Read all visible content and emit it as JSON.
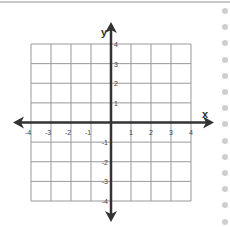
{
  "diagram": {
    "type": "coordinate-plane",
    "x_axis_label": "x",
    "y_axis_label": "y",
    "x_range": [
      -4,
      4
    ],
    "y_range": [
      -4,
      4
    ],
    "x_ticks": [
      "-4",
      "-3",
      "-2",
      "-1",
      "1",
      "2",
      "3",
      "4"
    ],
    "y_ticks": [
      "4",
      "3",
      "2",
      "1",
      "-1",
      "-2",
      "-3",
      "-4"
    ],
    "grid_step": 1
  },
  "sidebar": {
    "dot_count": 14,
    "dot_color": "#cfcfcf"
  },
  "colors": {
    "axis": "#333333",
    "grid": "#999999",
    "top_line": "#c8c8c8"
  }
}
